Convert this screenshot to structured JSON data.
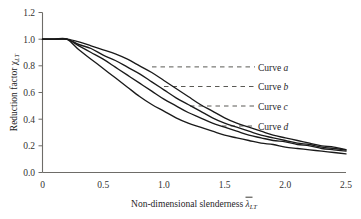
{
  "chart_data": {
    "type": "line",
    "title": "",
    "xlabel": "Non-dimensional slenderness",
    "xlabel_symbol": "λ",
    "xlabel_symbol_sub": "LT",
    "ylabel": "Reduction factor",
    "ylabel_symbol": "χ",
    "ylabel_symbol_sub": "LT",
    "xlim": [
      0,
      2.5
    ],
    "ylim": [
      0.0,
      1.2
    ],
    "xticks": [
      "0",
      "0.5",
      "1.0",
      "1.5",
      "2.0",
      "2.5"
    ],
    "xtick_values": [
      0,
      0.5,
      1.0,
      1.5,
      2.0,
      2.5
    ],
    "yticks": [
      "0.0",
      "0.2",
      "0.4",
      "0.6",
      "0.8",
      "1.0",
      "1.2"
    ],
    "ytick_values": [
      0.0,
      0.2,
      0.4,
      0.6,
      0.8,
      1.0,
      1.2
    ],
    "grid": false,
    "legend_position": "right-inside",
    "plateau_limit": 0.2,
    "x": [
      0.0,
      0.1,
      0.2,
      0.3,
      0.4,
      0.5,
      0.6,
      0.7,
      0.8,
      0.9,
      1.0,
      1.1,
      1.2,
      1.3,
      1.4,
      1.5,
      1.6,
      1.7,
      1.8,
      1.9,
      2.0,
      2.1,
      2.2,
      2.3,
      2.4,
      2.5
    ],
    "series": [
      {
        "name": "Curve a",
        "label": "Curve",
        "label_italic": "a",
        "alpha": 0.21,
        "values": [
          1.0,
          1.0,
          1.0,
          0.98,
          0.95,
          0.92,
          0.89,
          0.85,
          0.8,
          0.75,
          0.69,
          0.63,
          0.57,
          0.51,
          0.46,
          0.41,
          0.37,
          0.34,
          0.31,
          0.28,
          0.26,
          0.24,
          0.22,
          0.2,
          0.19,
          0.17
        ],
        "leader_y": 0.8,
        "leader_x_start": 0.9,
        "leader_x_end": 2.0
      },
      {
        "name": "Curve b",
        "label": "Curve",
        "label_italic": "b",
        "alpha": 0.34,
        "values": [
          1.0,
          1.0,
          1.0,
          0.96,
          0.93,
          0.88,
          0.84,
          0.79,
          0.74,
          0.68,
          0.62,
          0.56,
          0.51,
          0.46,
          0.41,
          0.37,
          0.34,
          0.31,
          0.28,
          0.26,
          0.24,
          0.22,
          0.21,
          0.19,
          0.18,
          0.17
        ],
        "leader_y": 0.655,
        "leader_x_start": 1.0,
        "leader_x_end": 2.0
      },
      {
        "name": "Curve c",
        "label": "Curve",
        "label_italic": "c",
        "alpha": 0.49,
        "values": [
          1.0,
          1.0,
          1.0,
          0.95,
          0.9,
          0.85,
          0.79,
          0.73,
          0.67,
          0.61,
          0.55,
          0.5,
          0.45,
          0.41,
          0.37,
          0.34,
          0.31,
          0.28,
          0.26,
          0.24,
          0.23,
          0.21,
          0.2,
          0.18,
          0.17,
          0.16
        ],
        "leader_y": 0.5,
        "leader_x_start": 1.22,
        "leader_x_end": 2.0
      },
      {
        "name": "Curve d",
        "label": "Curve",
        "label_italic": "d",
        "alpha": 0.76,
        "values": [
          1.0,
          1.0,
          1.0,
          0.92,
          0.85,
          0.78,
          0.71,
          0.64,
          0.57,
          0.51,
          0.46,
          0.41,
          0.37,
          0.34,
          0.31,
          0.28,
          0.26,
          0.24,
          0.22,
          0.21,
          0.19,
          0.18,
          0.17,
          0.16,
          0.15,
          0.14
        ]
      }
    ],
    "legend_entries": [
      {
        "prefix": "Curve",
        "symbol": "a"
      },
      {
        "prefix": "Curve",
        "symbol": "b"
      },
      {
        "prefix": "Curve",
        "symbol": "c"
      },
      {
        "prefix": "Curve",
        "symbol": "d"
      }
    ],
    "colors": {
      "curve": "#1a1a1a",
      "axis": "#6e6c68",
      "leader": "#5a5954",
      "background": "#ffffff"
    }
  }
}
